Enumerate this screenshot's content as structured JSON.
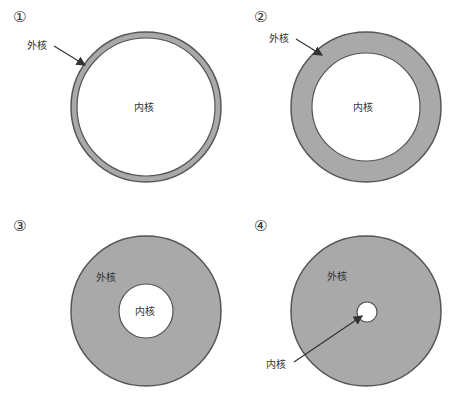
{
  "panels": [
    {
      "number": "①",
      "outer_label": "外核",
      "inner_label": "内核",
      "outer_r": 75,
      "inner_r": 69
    },
    {
      "number": "②",
      "outer_label": "外核",
      "inner_label": "内核",
      "outer_r": 75,
      "inner_r": 54
    },
    {
      "number": "③",
      "outer_label": "外核",
      "inner_label": "内核",
      "outer_r": 75,
      "inner_r": 27
    },
    {
      "number": "④",
      "outer_label": "外核",
      "inner_label": "内核",
      "outer_r": 75,
      "inner_r": 10
    }
  ],
  "colors": {
    "outer_fill": "#a9a9a9",
    "stroke": "#555555",
    "inner_fill": "#ffffff"
  }
}
